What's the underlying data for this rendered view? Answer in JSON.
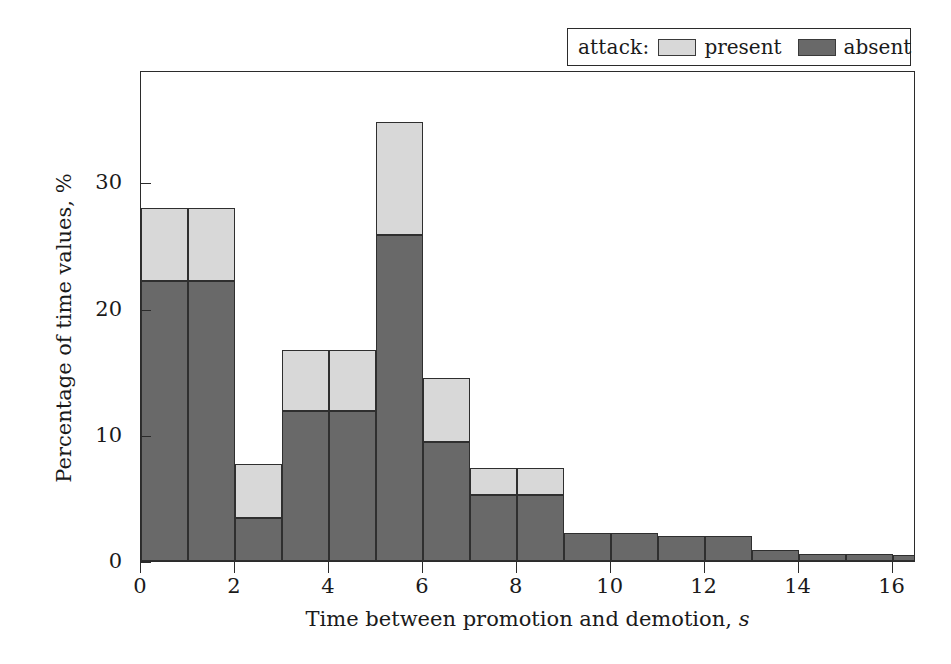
{
  "legend": {
    "title": "attack:",
    "entries": [
      {
        "label": "present",
        "swatch": "light-gray-swatch",
        "color": "#d8d8d8"
      },
      {
        "label": "absent",
        "swatch": "dark-gray-swatch",
        "color": "#696969"
      }
    ]
  },
  "axes": {
    "xlabel_text": "Time between promotion and demotion,",
    "xlabel_unit": "s",
    "ylabel": "Percentage of time values, %",
    "xticks": [
      "0",
      "2",
      "4",
      "6",
      "8",
      "10",
      "12",
      "14",
      "16"
    ],
    "yticks": [
      "0",
      "10",
      "20",
      "30"
    ]
  },
  "chart_data": {
    "type": "bar",
    "title": "",
    "xlabel": "Time between promotion and demotion, s",
    "ylabel": "Percentage of time values, %",
    "xlim": [
      0,
      16.5
    ],
    "ylim": [
      0,
      38.9
    ],
    "grid": false,
    "stacked": true,
    "legend_position": "top-right",
    "bin_width": 1,
    "bin_starts": [
      0,
      1,
      2,
      3,
      4,
      5,
      6,
      7,
      8,
      9,
      10,
      11,
      12,
      13,
      14,
      15,
      16
    ],
    "bin_labels": [
      "0–1",
      "1–2",
      "2–3",
      "3–4",
      "4–5",
      "5–6",
      "6–7",
      "7–8",
      "8–9",
      "9–10",
      "10–11",
      "11–12",
      "12–13",
      "13–14",
      "14–15",
      "15–16",
      "16–16.5"
    ],
    "series": [
      {
        "name": "absent",
        "color": "#696969",
        "values": [
          22.2,
          22.2,
          3.4,
          11.9,
          11.9,
          25.8,
          9.4,
          5.2,
          5.2,
          2.2,
          2.2,
          2.0,
          2.0,
          0.9,
          0.55,
          0.55,
          0.5
        ]
      },
      {
        "name": "present",
        "color": "#d8d8d8",
        "values": [
          5.8,
          5.8,
          4.3,
          4.8,
          4.8,
          9.0,
          5.1,
          2.2,
          2.2,
          0.0,
          0.0,
          0.0,
          0.0,
          0.0,
          0.0,
          0.0,
          0.0
        ]
      }
    ],
    "totals": [
      28.0,
      28.0,
      7.7,
      16.7,
      16.7,
      34.8,
      14.5,
      7.4,
      7.4,
      2.2,
      2.2,
      2.0,
      2.0,
      0.9,
      0.55,
      0.55,
      0.5
    ]
  }
}
